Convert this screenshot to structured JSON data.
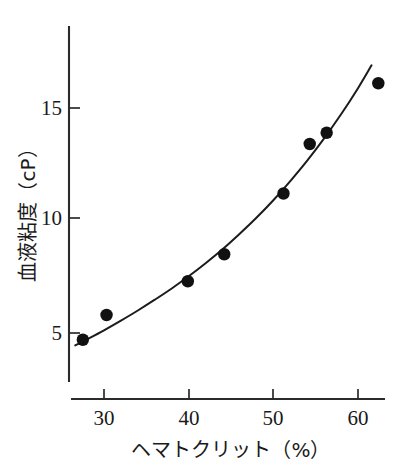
{
  "chart_data": {
    "type": "scatter",
    "title": "",
    "xlabel": "ヘマトクリット（%）",
    "ylabel": "血液粘度（cP）",
    "xlim": [
      25.5,
      64.5
    ],
    "ylim": [
      2.5,
      17.8
    ],
    "xticks": [
      30,
      40,
      50,
      60
    ],
    "xtick_labels": [
      "30",
      "40",
      "50",
      "60"
    ],
    "yticks": [
      5,
      10,
      15
    ],
    "ytick_labels": [
      "5",
      "10",
      "15"
    ],
    "grid": false,
    "legend": null,
    "series": [
      {
        "name": "測定値",
        "marker": "filled-circle",
        "color": "#111111",
        "points": [
          {
            "x": 27.5,
            "y": 4.7
          },
          {
            "x": 30.3,
            "y": 5.8
          },
          {
            "x": 39.9,
            "y": 7.3
          },
          {
            "x": 44.2,
            "y": 8.5
          },
          {
            "x": 51.2,
            "y": 11.2
          },
          {
            "x": 54.3,
            "y": 13.4
          },
          {
            "x": 56.3,
            "y": 13.9
          },
          {
            "x": 62.4,
            "y": 16.1
          }
        ]
      },
      {
        "name": "近似曲線",
        "marker": "none",
        "color": "#1c1c1c",
        "curve": [
          {
            "x": 26.6,
            "y": 4.45
          },
          {
            "x": 28.0,
            "y": 4.72
          },
          {
            "x": 30.0,
            "y": 5.12
          },
          {
            "x": 32.0,
            "y": 5.55
          },
          {
            "x": 34.0,
            "y": 6.0
          },
          {
            "x": 36.0,
            "y": 6.48
          },
          {
            "x": 38.0,
            "y": 6.98
          },
          {
            "x": 40.0,
            "y": 7.52
          },
          {
            "x": 42.0,
            "y": 8.1
          },
          {
            "x": 44.0,
            "y": 8.72
          },
          {
            "x": 46.0,
            "y": 9.4
          },
          {
            "x": 48.0,
            "y": 10.12
          },
          {
            "x": 50.0,
            "y": 10.9
          },
          {
            "x": 52.0,
            "y": 11.75
          },
          {
            "x": 54.0,
            "y": 12.66
          },
          {
            "x": 56.0,
            "y": 13.65
          },
          {
            "x": 58.0,
            "y": 14.72
          },
          {
            "x": 60.0,
            "y": 15.88
          },
          {
            "x": 61.6,
            "y": 16.9
          }
        ]
      }
    ]
  },
  "axes": {
    "x_axis_name": "hematocrit-axis",
    "y_axis_name": "blood-viscosity-axis"
  }
}
